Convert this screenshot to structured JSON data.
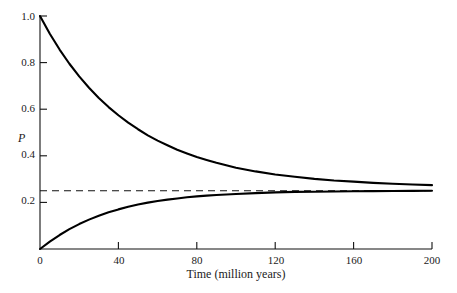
{
  "chart_data": {
    "type": "line",
    "title": "",
    "xlabel": "Time (million years)",
    "ylabel": "P",
    "xlim": [
      0,
      200
    ],
    "ylim": [
      0,
      1.0
    ],
    "xticks": [
      0,
      40,
      80,
      120,
      160,
      200
    ],
    "xtick_labels": [
      "0",
      "40",
      "80",
      "120",
      "160",
      "200"
    ],
    "yticks": [
      0,
      0.2,
      0.4,
      0.6,
      0.8,
      1.0
    ],
    "ytick_labels": [
      "0",
      "0.2",
      "0.4",
      "0.6",
      "0.8",
      "1.0"
    ],
    "grid": false,
    "legend": null,
    "annotations": [],
    "series": [
      {
        "name": "upper-curve",
        "style": "solid",
        "color": "#000000",
        "description": "Decaying curve from P=1.0 at t=0 approaching equilibrium 0.25",
        "x": [
          0,
          5,
          10,
          15,
          20,
          25,
          30,
          35,
          40,
          45,
          50,
          55,
          60,
          65,
          70,
          75,
          80,
          85,
          90,
          95,
          100,
          110,
          120,
          130,
          140,
          150,
          160,
          170,
          180,
          190,
          200
        ],
        "values": [
          1.0,
          0.924,
          0.856,
          0.795,
          0.741,
          0.692,
          0.648,
          0.609,
          0.574,
          0.542,
          0.514,
          0.488,
          0.465,
          0.445,
          0.426,
          0.41,
          0.395,
          0.382,
          0.37,
          0.359,
          0.349,
          0.333,
          0.32,
          0.31,
          0.301,
          0.294,
          0.289,
          0.284,
          0.28,
          0.277,
          0.274
        ]
      },
      {
        "name": "lower-curve",
        "style": "solid",
        "color": "#000000",
        "description": "Rising curve from P=0 at t=0 approaching equilibrium 0.25",
        "x": [
          0,
          5,
          10,
          15,
          20,
          25,
          30,
          35,
          40,
          45,
          50,
          55,
          60,
          65,
          70,
          75,
          80,
          85,
          90,
          95,
          100,
          110,
          120,
          130,
          140,
          150,
          160,
          170,
          180,
          190,
          200
        ],
        "values": [
          0.0,
          0.032,
          0.06,
          0.085,
          0.107,
          0.126,
          0.143,
          0.158,
          0.17,
          0.181,
          0.191,
          0.199,
          0.206,
          0.212,
          0.217,
          0.222,
          0.226,
          0.229,
          0.232,
          0.234,
          0.236,
          0.24,
          0.243,
          0.245,
          0.246,
          0.247,
          0.248,
          0.2485,
          0.249,
          0.2495,
          0.25
        ]
      },
      {
        "name": "equilibrium-line",
        "style": "dashed",
        "color": "#000000",
        "description": "Horizontal dashed asymptote",
        "x": [
          0,
          200
        ],
        "values": [
          0.25,
          0.25
        ]
      }
    ]
  },
  "axes": {
    "y_title": "P",
    "x_title": "Time (million years)"
  }
}
